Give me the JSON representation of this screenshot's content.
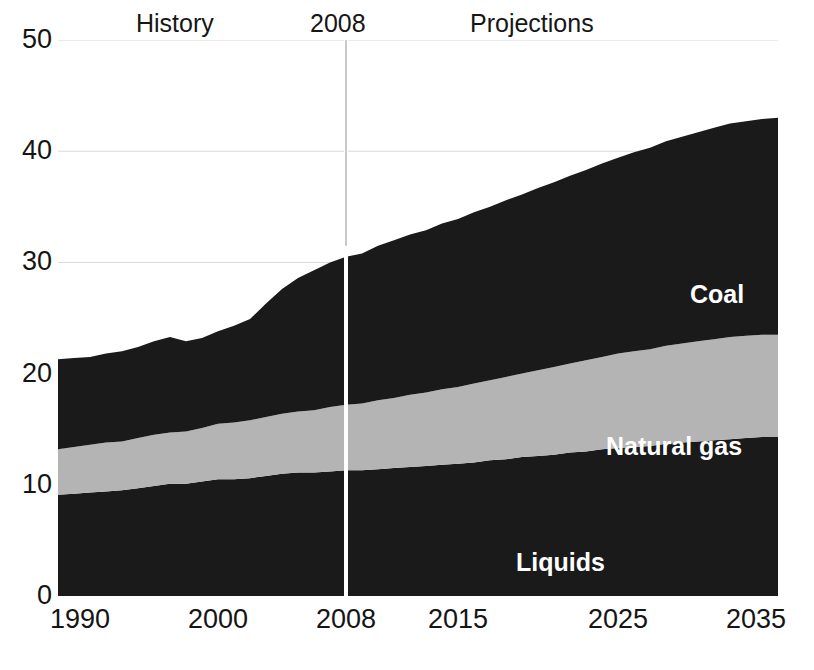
{
  "annotations": {
    "history_label": "History",
    "divider_year_label": "2008",
    "projections_label": "Projections"
  },
  "series_labels": {
    "coal": "Coal",
    "natural_gas": "Natural gas",
    "liquids": "Liquids"
  },
  "colors": {
    "coal": "#1a1a1a",
    "natural_gas": "#b4b4b4",
    "liquids": "#1a1a1a",
    "axis": "#151515",
    "divider": "#ffffff",
    "gridline": "#d8d8d8",
    "background": "#ffffff",
    "label_text": "#ffffff"
  },
  "chart_data": {
    "type": "area",
    "stacked": true,
    "title": "",
    "subtitle": "",
    "xlabel": "",
    "ylabel": "",
    "xlim": [
      1990,
      2035
    ],
    "ylim": [
      0,
      50
    ],
    "grid": false,
    "legend_position": "inline-labels",
    "x_tick_labels": [
      "1990",
      "2000",
      "2008",
      "2015",
      "2025",
      "2035"
    ],
    "x_ticks": [
      1990,
      2000,
      2008,
      2015,
      2025,
      2035
    ],
    "y_tick_labels": [
      "0",
      "10",
      "20",
      "30",
      "40",
      "50"
    ],
    "y_ticks": [
      0,
      10,
      20,
      30,
      40,
      50
    ],
    "divider_x": 2008,
    "x": [
      1990,
      1991,
      1992,
      1993,
      1994,
      1995,
      1996,
      1997,
      1998,
      1999,
      2000,
      2001,
      2002,
      2003,
      2004,
      2005,
      2006,
      2007,
      2008,
      2009,
      2010,
      2011,
      2012,
      2013,
      2014,
      2015,
      2016,
      2017,
      2018,
      2019,
      2020,
      2021,
      2022,
      2023,
      2024,
      2025,
      2026,
      2027,
      2028,
      2029,
      2030,
      2031,
      2032,
      2033,
      2034,
      2035
    ],
    "series": [
      {
        "name": "Liquids",
        "color": "#1a1a1a",
        "values": [
          9.1,
          9.2,
          9.3,
          9.4,
          9.5,
          9.7,
          9.9,
          10.1,
          10.1,
          10.3,
          10.5,
          10.5,
          10.6,
          10.8,
          11.0,
          11.1,
          11.1,
          11.2,
          11.3,
          11.3,
          11.4,
          11.5,
          11.6,
          11.7,
          11.8,
          11.9,
          12.0,
          12.2,
          12.3,
          12.5,
          12.6,
          12.7,
          12.9,
          13.0,
          13.2,
          13.3,
          13.4,
          13.5,
          13.7,
          13.8,
          13.9,
          14.0,
          14.1,
          14.2,
          14.3,
          14.3
        ]
      },
      {
        "name": "Natural gas",
        "color": "#b4b4b4",
        "values": [
          4.1,
          4.2,
          4.3,
          4.4,
          4.4,
          4.5,
          4.6,
          4.6,
          4.7,
          4.8,
          5.0,
          5.1,
          5.2,
          5.3,
          5.4,
          5.5,
          5.6,
          5.8,
          5.9,
          6.0,
          6.2,
          6.3,
          6.5,
          6.6,
          6.8,
          6.9,
          7.1,
          7.2,
          7.4,
          7.5,
          7.7,
          7.9,
          8.0,
          8.2,
          8.3,
          8.5,
          8.6,
          8.7,
          8.8,
          8.9,
          9.0,
          9.1,
          9.2,
          9.2,
          9.2,
          9.2
        ]
      },
      {
        "name": "Coal",
        "color": "#1a1a1a",
        "values": [
          8.1,
          8.0,
          7.9,
          8.0,
          8.1,
          8.2,
          8.4,
          8.6,
          8.1,
          8.1,
          8.3,
          8.7,
          9.1,
          10.2,
          11.2,
          12.0,
          12.6,
          13.0,
          13.3,
          13.5,
          13.9,
          14.2,
          14.4,
          14.6,
          14.9,
          15.1,
          15.4,
          15.6,
          15.9,
          16.1,
          16.4,
          16.6,
          16.9,
          17.1,
          17.4,
          17.6,
          17.9,
          18.1,
          18.4,
          18.6,
          18.8,
          19.0,
          19.2,
          19.3,
          19.4,
          19.5
        ]
      }
    ]
  }
}
